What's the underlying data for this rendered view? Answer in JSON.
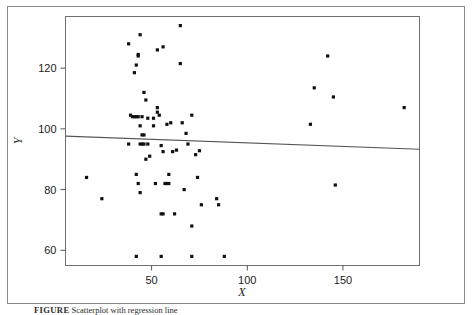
{
  "figure": {
    "caption_label": "FIGURE",
    "caption_text": "Scatterplot with regression line",
    "background_color": "#ffffff",
    "frame_color": "#8a8a8a",
    "axis_color": "#555555",
    "point_color": "#111111",
    "line_color": "#555555"
  },
  "chart_data": {
    "type": "scatter",
    "title": "",
    "xlabel": "X",
    "ylabel": "Y",
    "xlim": [
      5,
      190
    ],
    "ylim": [
      55,
      137
    ],
    "xticks": [
      50,
      100,
      150
    ],
    "xtick_labels": [
      "50",
      "100",
      "150"
    ],
    "yticks": [
      60,
      80,
      100,
      120
    ],
    "ytick_labels": [
      "60",
      "80",
      "100",
      "120"
    ],
    "grid": false,
    "legend": null,
    "series": [
      {
        "name": "observations",
        "marker": "square",
        "points": [
          [
            65,
            134
          ],
          [
            44,
            131
          ],
          [
            38,
            128
          ],
          [
            56,
            127
          ],
          [
            53,
            126
          ],
          [
            142,
            124
          ],
          [
            43,
            124.5
          ],
          [
            43,
            124
          ],
          [
            65,
            121.5
          ],
          [
            42,
            121
          ],
          [
            41,
            118.5
          ],
          [
            135,
            113.5
          ],
          [
            145,
            110.5
          ],
          [
            46,
            112
          ],
          [
            47,
            109.5
          ],
          [
            182,
            107
          ],
          [
            53,
            107
          ],
          [
            53,
            105.5
          ],
          [
            71,
            104.5
          ],
          [
            54,
            104.5
          ],
          [
            43,
            104
          ],
          [
            41,
            104
          ],
          [
            40,
            104
          ],
          [
            42,
            104
          ],
          [
            45,
            104
          ],
          [
            39,
            104.5
          ],
          [
            48,
            103.5
          ],
          [
            51,
            103.5
          ],
          [
            133,
            101.5
          ],
          [
            60,
            102
          ],
          [
            66,
            102
          ],
          [
            58,
            101.5
          ],
          [
            44,
            101
          ],
          [
            51,
            101
          ],
          [
            68,
            98.5
          ],
          [
            45,
            98
          ],
          [
            46,
            98
          ],
          [
            38,
            95
          ],
          [
            44,
            95
          ],
          [
            45,
            95
          ],
          [
            46,
            95
          ],
          [
            48,
            95
          ],
          [
            69,
            95
          ],
          [
            55,
            94.5
          ],
          [
            63,
            93
          ],
          [
            75,
            92.8
          ],
          [
            56,
            92.5
          ],
          [
            61,
            92.5
          ],
          [
            73,
            91.5
          ],
          [
            49,
            91
          ],
          [
            47,
            90
          ],
          [
            42,
            85
          ],
          [
            59,
            85
          ],
          [
            74,
            84
          ],
          [
            43,
            82
          ],
          [
            52,
            82
          ],
          [
            57,
            82
          ],
          [
            58,
            82
          ],
          [
            59,
            82
          ],
          [
            146,
            81.5
          ],
          [
            44,
            79
          ],
          [
            67,
            80
          ],
          [
            24,
            77
          ],
          [
            84,
            77
          ],
          [
            76,
            75
          ],
          [
            85,
            75
          ],
          [
            16,
            84
          ],
          [
            55,
            72
          ],
          [
            56,
            72
          ],
          [
            62,
            72
          ],
          [
            71,
            68
          ],
          [
            42,
            58
          ],
          [
            55,
            58
          ],
          [
            71,
            58
          ],
          [
            88,
            58
          ]
        ]
      }
    ],
    "regression_line": {
      "x_start": 5,
      "y_start": 97.6,
      "x_end": 190,
      "y_end": 93.3,
      "description": "least-squares fit, slight negative slope"
    }
  }
}
